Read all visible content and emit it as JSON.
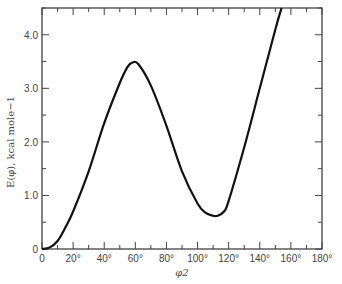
{
  "chart_data": {
    "type": "line",
    "title": "",
    "xlabel": "φ2",
    "ylabel": "E(φ), kcal mole−1",
    "xlim": [
      0,
      180
    ],
    "ylim": [
      0,
      4.5
    ],
    "grid": false,
    "legend": null,
    "x_ticks": [
      "0",
      "20°",
      "40°",
      "60°",
      "80°",
      "100°",
      "120°",
      "140°",
      "160°",
      "180°"
    ],
    "y_ticks": [
      "0",
      "1.0",
      "2.0",
      "3.0",
      "4.0"
    ],
    "series": [
      {
        "name": "E(φ)",
        "x": [
          0,
          5,
          10,
          15,
          20,
          30,
          40,
          50,
          55,
          58,
          62,
          70,
          80,
          90,
          100,
          105,
          110,
          113,
          117,
          120,
          130,
          140,
          150,
          154
        ],
        "values": [
          0,
          0.03,
          0.15,
          0.4,
          0.7,
          1.45,
          2.35,
          3.1,
          3.4,
          3.48,
          3.45,
          3.05,
          2.3,
          1.45,
          0.85,
          0.68,
          0.62,
          0.62,
          0.7,
          0.9,
          1.9,
          3.0,
          4.1,
          4.5
        ],
        "color": "#111111"
      }
    ]
  },
  "labels": {
    "xlabel": "φ2",
    "ylabel": "E(φ), kcal mole−1"
  }
}
